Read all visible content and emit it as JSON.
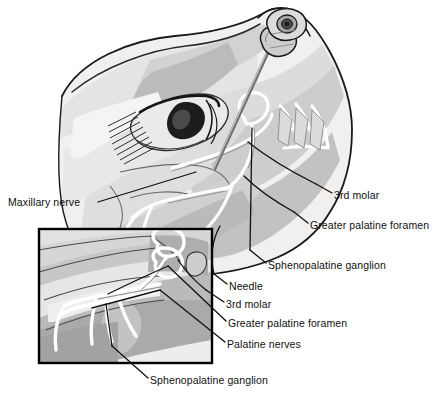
{
  "figure": {
    "background_color": "#ffffff",
    "width": 434,
    "height": 397,
    "illustration_style": "grayscale medical line drawing",
    "palette": {
      "outline": "#1a1a1a",
      "skin_light": "#f0eeec",
      "skin_mid": "#dcdad8",
      "skin_shadow": "#c2c0be",
      "deep_shadow": "#a8a6a4",
      "nerve_highlight": "#ffffff",
      "needle_gray": "#9a9a9a",
      "inset_border": "#000000",
      "leader_line": "#111111",
      "label_text": "#101010"
    }
  },
  "labels": {
    "maxillary_nerve": "Maxillary nerve",
    "third_molar_main": "3rd molar",
    "greater_palatine_foramen_main": "Greater palatine foramen",
    "sphenopalatine_ganglion_main": "Sphenopalatine ganglion",
    "needle": "Needle",
    "third_molar_inset": "3rd molar",
    "greater_palatine_foramen_inset": "Greater palatine foramen",
    "palatine_nerves": "Palatine nerves",
    "sphenopalatine_ganglion_bottom": "Sphenopalatine ganglion"
  },
  "parts": {
    "head_profile": "head-profile",
    "eye": "eye",
    "eyebrow": "eyebrow",
    "nose": "nose",
    "syringe_hub": "syringe-hub",
    "needle_shaft": "needle-shaft",
    "nerve_network": "nerve-network",
    "teeth": "teeth",
    "inset_box": "inset-detail-box"
  }
}
